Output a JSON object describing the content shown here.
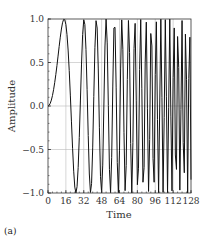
{
  "chart_data": {
    "type": "line",
    "title": "",
    "xlabel": "Time",
    "ylabel": "Amplitude",
    "xlim": [
      0,
      128
    ],
    "ylim": [
      -1.0,
      1.0
    ],
    "x_ticks": [
      0,
      16,
      32,
      48,
      64,
      80,
      96,
      112,
      128
    ],
    "y_ticks": [
      -1.0,
      -0.5,
      0.0,
      0.5,
      1.0
    ],
    "y_tick_labels": [
      "−1.0",
      "−0.5",
      "0.0",
      "0.5",
      "1.0"
    ],
    "grid": true,
    "legend": null,
    "series": [
      {
        "name": "chirp signal",
        "description": "sine wave with linearly increasing frequency (chirp), amplitude 1, starting at 0",
        "function": "sin(2*pi*k*t^2)",
        "k": 0.0012,
        "sample_step": 1,
        "color": "#111111"
      }
    ],
    "panel_label": "(a)"
  }
}
